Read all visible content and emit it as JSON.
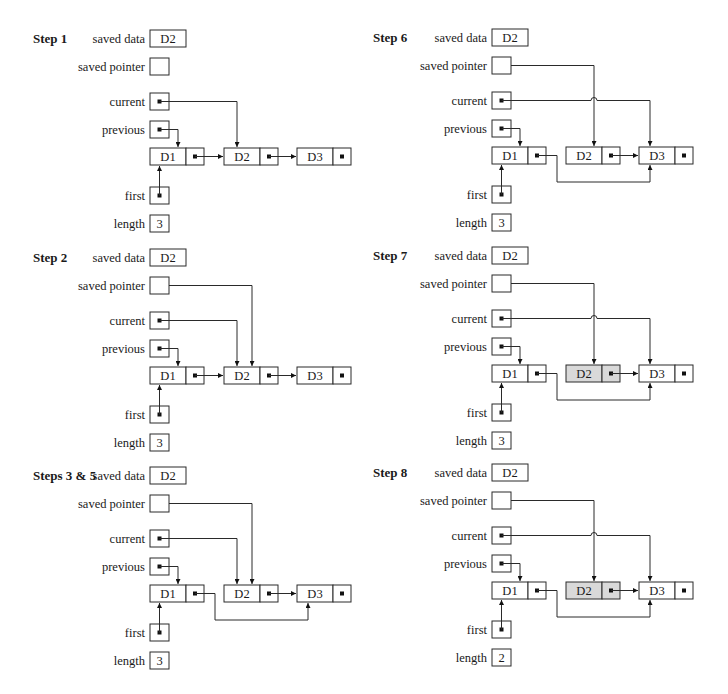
{
  "colors": {
    "stroke": "#2a2a2a",
    "deleted_node_fill": "#d9d9d9",
    "background": "#ffffff"
  },
  "labels": {
    "saved_data": "saved data",
    "saved_pointer": "saved pointer",
    "current": "current",
    "previous": "previous",
    "first": "first",
    "length": "length"
  },
  "steps": [
    {
      "id": "step1",
      "title": "Step 1",
      "origin": {
        "x": 150,
        "y": 30
      },
      "saved_data": "D2",
      "saved_pointer_target": null,
      "current_target": "D2",
      "previous_target": "D1",
      "d1_next": "D2",
      "d2_next": "D3",
      "d2_deleted": false,
      "length": "3",
      "nodes": [
        {
          "label": "D1"
        },
        {
          "label": "D2"
        },
        {
          "label": "D3"
        }
      ]
    },
    {
      "id": "step2",
      "title": "Step 2",
      "origin": {
        "x": 150,
        "y": 249
      },
      "saved_data": "D2",
      "saved_pointer_target": "D2",
      "current_target": "D2",
      "previous_target": "D1",
      "d1_next": "D2",
      "d2_next": "D3",
      "d2_deleted": false,
      "length": "3",
      "nodes": [
        {
          "label": "D1"
        },
        {
          "label": "D2"
        },
        {
          "label": "D3"
        }
      ]
    },
    {
      "id": "step3-5",
      "title": "Steps 3 & 5",
      "origin": {
        "x": 150,
        "y": 467
      },
      "saved_data": "D2",
      "saved_pointer_target": "D2",
      "current_target": "D2",
      "previous_target": "D1",
      "d1_next": "D3",
      "d2_next": "D3",
      "d2_deleted": false,
      "length": "3",
      "nodes": [
        {
          "label": "D1"
        },
        {
          "label": "D2"
        },
        {
          "label": "D3"
        }
      ]
    },
    {
      "id": "step6",
      "title": "Step 6",
      "origin": {
        "x": 492,
        "y": 29
      },
      "saved_data": "D2",
      "saved_pointer_target": "D2",
      "current_target": "D3",
      "previous_target": "D1",
      "d1_next": "D3",
      "d2_next": "D3",
      "d2_deleted": false,
      "length": "3",
      "nodes": [
        {
          "label": "D1"
        },
        {
          "label": "D2"
        },
        {
          "label": "D3"
        }
      ]
    },
    {
      "id": "step7",
      "title": "Step 7",
      "origin": {
        "x": 492,
        "y": 247
      },
      "saved_data": "D2",
      "saved_pointer_target": "D2",
      "current_target": "D3",
      "previous_target": "D1",
      "d1_next": "D3",
      "d2_next": "D3",
      "d2_deleted": true,
      "length": "3",
      "nodes": [
        {
          "label": "D1"
        },
        {
          "label": "D2"
        },
        {
          "label": "D3"
        }
      ]
    },
    {
      "id": "step8",
      "title": "Step 8",
      "origin": {
        "x": 492,
        "y": 464
      },
      "saved_data": "D2",
      "saved_pointer_target": "D2",
      "current_target": "D3",
      "previous_target": "D1",
      "d1_next": "D3",
      "d2_next": "D3",
      "d2_deleted": true,
      "length": "2",
      "nodes": [
        {
          "label": "D1"
        },
        {
          "label": "D2"
        },
        {
          "label": "D3"
        }
      ]
    }
  ]
}
